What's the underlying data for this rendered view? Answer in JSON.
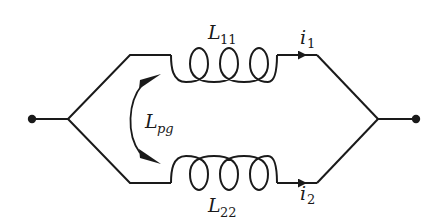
{
  "diagram": {
    "type": "circuit",
    "colors": {
      "stroke": "#1a1a1a",
      "background": "#ffffff"
    },
    "terminals": [
      {
        "id": "left-terminal"
      },
      {
        "id": "right-terminal"
      }
    ],
    "inductors": [
      {
        "id": "L11",
        "symbol": "L",
        "subscript": "11",
        "turns": 3,
        "branch": "top"
      },
      {
        "id": "L22",
        "symbol": "L",
        "subscript": "22",
        "turns": 3,
        "branch": "bottom"
      }
    ],
    "currents": [
      {
        "id": "i1",
        "symbol": "i",
        "subscript": "1",
        "branch": "top",
        "direction": "right"
      },
      {
        "id": "i2",
        "symbol": "i",
        "subscript": "2",
        "branch": "bottom",
        "direction": "right"
      }
    ],
    "mutual": {
      "symbol": "L",
      "subscript": "pg",
      "between": [
        "L11",
        "L22"
      ],
      "arrow": "double-headed"
    }
  },
  "labels": {
    "L11_main": "L",
    "L11_sub": "11",
    "L22_main": "L",
    "L22_sub": "22",
    "i1_main": "i",
    "i1_sub": "1",
    "i2_main": "i",
    "i2_sub": "2",
    "Lpg_main": "L",
    "Lpg_sub": "pg"
  }
}
